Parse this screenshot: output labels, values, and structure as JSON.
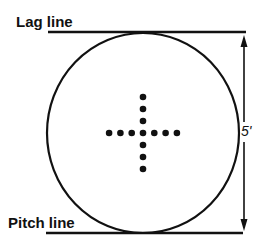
{
  "diagram": {
    "labels": {
      "top_line": "Lag line",
      "bottom_line": "Pitch line",
      "dimension": "5'"
    },
    "circle": {
      "cx": 143,
      "cy": 133,
      "rx": 96,
      "ry": 100
    },
    "lines": {
      "lag": {
        "x1": 48,
        "y1": 32,
        "x2": 246,
        "y2": 32
      },
      "pitch": {
        "x1": 46,
        "y1": 233,
        "x2": 243,
        "y2": 233
      }
    },
    "cross": {
      "horizontal_dots": 7,
      "vertical_dots": 7,
      "center": {
        "x": 143,
        "y": 133
      },
      "spacing_x": 11.3,
      "spacing_y": 12,
      "dot_radius": 3.3
    },
    "colors": {
      "stroke": "#111111",
      "background": "#ffffff"
    }
  }
}
